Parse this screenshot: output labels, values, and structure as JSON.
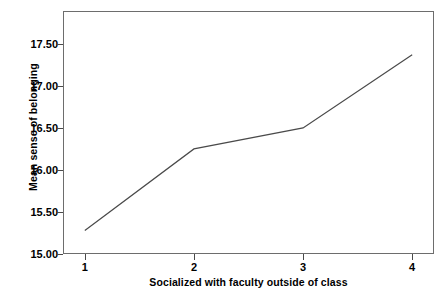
{
  "chart_data": {
    "type": "line",
    "title": "",
    "subtitle": "",
    "xlabel": "Socialized with faculty outside of class",
    "ylabel": "Mean sense of belonging",
    "categories": [
      "1",
      "2",
      "3",
      "4"
    ],
    "x": [
      1,
      2,
      3,
      4
    ],
    "values": [
      15.28,
      16.25,
      16.5,
      17.37
    ],
    "series": [
      {
        "name": "Mean sense of belonging",
        "values": [
          15.28,
          16.25,
          16.5,
          17.37
        ]
      }
    ],
    "xlim": [
      0.8,
      4.2
    ],
    "ylim": [
      15.0,
      17.89
    ],
    "yticks": [
      15.0,
      15.5,
      16.0,
      16.5,
      17.0,
      17.5
    ],
    "ytick_labels": [
      "15.00",
      "15.50",
      "16.00",
      "16.50",
      "17.00",
      "17.50"
    ],
    "xticks": [
      1,
      2,
      3,
      4
    ],
    "xtick_labels": [
      "1",
      "2",
      "3",
      "4"
    ],
    "grid": false,
    "legend": false,
    "legend_position": "none",
    "line_color": "#4a4a4a",
    "frame_color": "#6d6d6d",
    "background_color": "#ffffff",
    "text_color": "#000000"
  }
}
